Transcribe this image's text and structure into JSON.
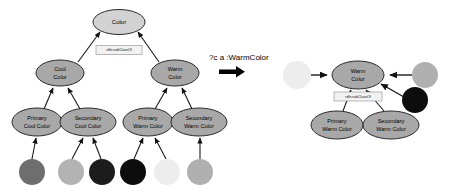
{
  "diagram": {
    "left_panel": {
      "name": "class-hierarchy",
      "property_label": "rdfs:subClassOf",
      "nodes": [
        {
          "id": "color",
          "label": "Color",
          "label_lines": [
            "Color"
          ],
          "cx": 119,
          "cy": 22,
          "rx": 26,
          "ry": 12.5,
          "fill": "#d2d2d2"
        },
        {
          "id": "cool-color",
          "label": "Cool Color",
          "label_lines": [
            "Cool",
            "Color"
          ],
          "cx": 60,
          "cy": 73,
          "rx": 24,
          "ry": 13,
          "fill": "#a8a8a8"
        },
        {
          "id": "warm-color",
          "label": "Warm Color",
          "label_lines": [
            "Warm",
            "Color"
          ],
          "cx": 175,
          "cy": 73,
          "rx": 24,
          "ry": 13,
          "fill": "#a8a8a8"
        },
        {
          "id": "primary-cool",
          "label": "Primary Cool Color",
          "label_lines": [
            "Primary",
            "Cool Color"
          ],
          "cx": 37,
          "cy": 122,
          "rx": 25,
          "ry": 14,
          "fill": "#a8a8a8"
        },
        {
          "id": "secondary-cool",
          "label": "Secondary Cool Color",
          "label_lines": [
            "Secondary",
            "Cool Color"
          ],
          "cx": 88,
          "cy": 122,
          "rx": 28,
          "ry": 14,
          "fill": "#a8a8a8"
        },
        {
          "id": "primary-warm",
          "label": "Primary Warm Color",
          "label_lines": [
            "Primary",
            "Warm Color"
          ],
          "cx": 148,
          "cy": 122,
          "rx": 25,
          "ry": 14,
          "fill": "#a8a8a8"
        },
        {
          "id": "secondary-warm",
          "label": "Secondary Warm Color",
          "label_lines": [
            "Secondary",
            "Warm Color"
          ],
          "cx": 199,
          "cy": 122,
          "rx": 28,
          "ry": 14,
          "fill": "#a8a8a8"
        }
      ],
      "swatches": [
        {
          "id": "swatch-cool-1",
          "cx": 32,
          "cy": 172,
          "r": 13,
          "fill": "#6e6e6e",
          "parent": "primary-cool"
        },
        {
          "id": "swatch-cool-2",
          "cx": 71,
          "cy": 172,
          "r": 13,
          "fill": "#b3b3b3",
          "parent": "secondary-cool"
        },
        {
          "id": "swatch-cool-3",
          "cx": 102,
          "cy": 172,
          "r": 13,
          "fill": "#1c1c1c",
          "parent": "secondary-cool"
        },
        {
          "id": "swatch-warm-1",
          "cx": 133,
          "cy": 172,
          "r": 13,
          "fill": "#0d0d0d",
          "parent": "primary-warm"
        },
        {
          "id": "swatch-warm-2",
          "cx": 167,
          "cy": 172,
          "r": 13,
          "fill": "#ededed",
          "parent": "primary-warm"
        },
        {
          "id": "swatch-warm-3",
          "cx": 200,
          "cy": 172,
          "r": 13,
          "fill": "#b0b0b0",
          "parent": "secondary-warm"
        }
      ]
    },
    "query": {
      "name": "sparql-query",
      "text": "?c a :WarmColor",
      "arrow": "right-arrow"
    },
    "right_panel": {
      "name": "query-result",
      "property_label": "rdfs:subClassOf",
      "nodes": [
        {
          "id": "r-warm-color",
          "label": "Warm Color",
          "label_lines": [
            "Warm",
            "Color"
          ],
          "cx": 358,
          "cy": 75,
          "rx": 26,
          "ry": 14,
          "fill": "#a8a8a8"
        },
        {
          "id": "r-primary-warm",
          "label": "Primary Warm Color",
          "label_lines": [
            "Primary",
            "Warm Color"
          ],
          "cx": 337,
          "cy": 125,
          "rx": 26,
          "ry": 14,
          "fill": "#a8a8a8"
        },
        {
          "id": "r-secondary-warm",
          "label": "Secondary Warm Color",
          "label_lines": [
            "Secondary",
            "Warm Color"
          ],
          "cx": 391,
          "cy": 125,
          "rx": 28,
          "ry": 14,
          "fill": "#a8a8a8"
        }
      ],
      "swatches": [
        {
          "id": "r-swatch-left",
          "cx": 297,
          "cy": 75,
          "r": 14,
          "fill": "#ededed"
        },
        {
          "id": "r-swatch-right",
          "cx": 425,
          "cy": 75,
          "r": 13,
          "fill": "#b0b0b0"
        },
        {
          "id": "r-swatch-dark",
          "cx": 415,
          "cy": 100,
          "r": 13,
          "fill": "#0d0d0d"
        }
      ]
    }
  }
}
